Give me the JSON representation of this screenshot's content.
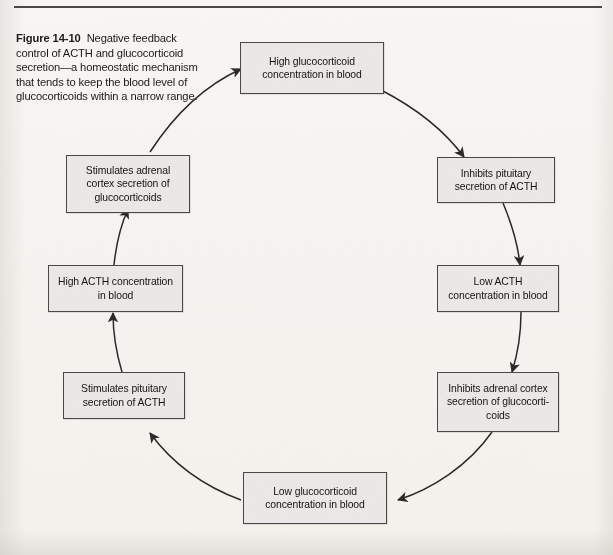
{
  "figure": {
    "label": "Figure 14-10",
    "caption": "Negative feedback control of ACTH and glucocorticoid secretion—a homeostatic mechanism that tends to keep the blood level of glucocorticoids within a narrow range.",
    "colors": {
      "page_background": "#f6f5f2",
      "box_fill": "#e9e8e6",
      "box_border": "#4a4846",
      "arrow": "#2b2a29",
      "text": "#151413",
      "rule": "#3c3a38"
    }
  },
  "diagram": {
    "type": "cycle",
    "direction": "clockwise",
    "nodes": [
      {
        "id": "high-glucocorticoid",
        "position": "top",
        "text": "High glucocorticoid concentration in blood"
      },
      {
        "id": "inhibits-pituitary",
        "position": "right-upper",
        "text": "Inhibits pituitary secretion of ACTH"
      },
      {
        "id": "low-acth",
        "position": "right",
        "text": "Low ACTH concentration in blood"
      },
      {
        "id": "inhibits-adrenal",
        "position": "right-lower",
        "text": "Inhibits adrenal cortex secretion of glucocorti-coids"
      },
      {
        "id": "low-glucocorticoid",
        "position": "bottom",
        "text": "Low glucocorticoid concentration in blood"
      },
      {
        "id": "stimulates-pituitary",
        "position": "left-lower",
        "text": "Stimulates pituitary secretion of ACTH"
      },
      {
        "id": "high-acth",
        "position": "left",
        "text": "High ACTH concentration in blood"
      },
      {
        "id": "stimulates-adrenal",
        "position": "left-upper",
        "text": "Stimulates adrenal cortex secretion of glucocorticoids"
      }
    ],
    "edges": [
      {
        "from": "high-glucocorticoid",
        "to": "inhibits-pituitary"
      },
      {
        "from": "inhibits-pituitary",
        "to": "low-acth"
      },
      {
        "from": "low-acth",
        "to": "inhibits-adrenal"
      },
      {
        "from": "inhibits-adrenal",
        "to": "low-glucocorticoid"
      },
      {
        "from": "low-glucocorticoid",
        "to": "stimulates-pituitary"
      },
      {
        "from": "stimulates-pituitary",
        "to": "high-acth"
      },
      {
        "from": "high-acth",
        "to": "stimulates-adrenal"
      },
      {
        "from": "stimulates-adrenal",
        "to": "high-glucocorticoid"
      }
    ]
  }
}
